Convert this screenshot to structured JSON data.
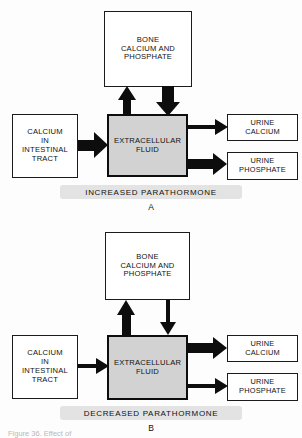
{
  "figure": {
    "caption": "Figure 36.  Effect of",
    "panels": [
      {
        "letter": "A",
        "condition_label": "INCREASED  PARATHORMONE",
        "boxes": {
          "bone": "BONE\nCALCIUM AND\nPHOSPHATE",
          "source": "CALCIUM\nIN\nINTESTINAL\nTRACT",
          "center": "EXTRACELLULAR\nFLUID",
          "urine_calcium": "URINE\nCALCIUM",
          "urine_phosphate": "URINE\nPHOSPHATE"
        },
        "flows": [
          {
            "name": "intestinal-absorption",
            "from": "CALCIUM IN INTESTINAL TRACT",
            "to": "EXTRACELLULAR FLUID",
            "direction": "right",
            "magnitude": "large"
          },
          {
            "name": "bone-resorption",
            "from": "BONE CALCIUM AND PHOSPHATE",
            "to": "EXTRACELLULAR FLUID",
            "direction": "up",
            "magnitude": "large"
          },
          {
            "name": "bone-deposition",
            "from": "EXTRACELLULAR FLUID",
            "to": "BONE CALCIUM AND PHOSPHATE",
            "direction": "down",
            "magnitude": "large"
          },
          {
            "name": "urine-calcium-excretion",
            "from": "EXTRACELLULAR FLUID",
            "to": "URINE CALCIUM",
            "direction": "right",
            "magnitude": "small"
          },
          {
            "name": "urine-phosphate-excretion",
            "from": "EXTRACELLULAR FLUID",
            "to": "URINE PHOSPHATE",
            "direction": "right",
            "magnitude": "large"
          }
        ]
      },
      {
        "letter": "B",
        "condition_label": "DECREASED  PARATHORMONE",
        "boxes": {
          "bone": "BONE\nCALCIUM AND\nPHOSPHATE",
          "source": "CALCIUM\nIN\nINTESTINAL\nTRACT",
          "center": "EXTRACELLULAR\nFLUID",
          "urine_calcium": "URINE\nCALCIUM",
          "urine_phosphate": "URINE\nPHOSPHATE"
        },
        "flows": [
          {
            "name": "intestinal-absorption",
            "from": "CALCIUM IN INTESTINAL TRACT",
            "to": "EXTRACELLULAR FLUID",
            "direction": "right",
            "magnitude": "small"
          },
          {
            "name": "bone-resorption",
            "from": "BONE CALCIUM AND PHOSPHATE",
            "to": "EXTRACELLULAR FLUID",
            "direction": "up",
            "magnitude": "large"
          },
          {
            "name": "bone-deposition",
            "from": "EXTRACELLULAR FLUID",
            "to": "BONE CALCIUM AND PHOSPHATE",
            "direction": "down",
            "magnitude": "small"
          },
          {
            "name": "urine-calcium-excretion",
            "from": "EXTRACELLULAR FLUID",
            "to": "URINE CALCIUM",
            "direction": "right",
            "magnitude": "large"
          },
          {
            "name": "urine-phosphate-excretion",
            "from": "EXTRACELLULAR FLUID",
            "to": "URINE PHOSPHATE",
            "direction": "right",
            "magnitude": "small"
          }
        ]
      }
    ]
  },
  "colors": {
    "ink": "#0d0d0d",
    "ecf_fill": "#d2d2d2",
    "banner": "#e3e3e3",
    "page": "#fdfdfd"
  }
}
